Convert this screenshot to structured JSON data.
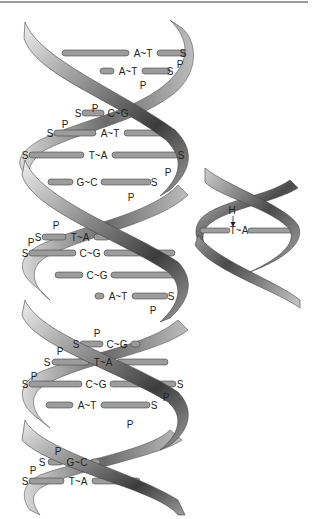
{
  "diagram": {
    "colors": {
      "ribbon_dark": "#3a3a3a",
      "ribbon_mid": "#8a8a8a",
      "ribbon_light": "#e6e6e6",
      "rod_fill": "#9c9c9c",
      "rod_stroke": "#444444",
      "text": "#222222",
      "top_border": "#9a9a9a"
    },
    "legend_symbols": {
      "S": "sugar (deoxyribose)",
      "P": "phosphate",
      "H": "hydrogen bond"
    },
    "base_pairs": [
      {
        "y": 53,
        "label": "A~T",
        "lx": 62,
        "rx": 185,
        "tx": 143,
        "s_left": null,
        "s_right": 183
      },
      {
        "y": 71,
        "label": "A~T",
        "lx": 100,
        "rx": 170,
        "tx": 128,
        "s_left": null,
        "s_right": 170
      },
      {
        "y": 113,
        "label": "C~G",
        "lx": 82,
        "rx": 140,
        "tx": 118,
        "s_left": 78,
        "s_right": null
      },
      {
        "y": 133,
        "label": "A~T",
        "lx": 54,
        "rx": 165,
        "tx": 110,
        "s_left": 50,
        "s_right": null
      },
      {
        "y": 155,
        "label": "T~A",
        "lx": 29,
        "rx": 179,
        "tx": 98,
        "s_left": 25,
        "s_right": 181
      },
      {
        "y": 182,
        "label": "G~C",
        "lx": 48,
        "rx": 151,
        "tx": 87,
        "s_left": null,
        "s_right": 154
      },
      {
        "y": 237,
        "label": "T~A",
        "lx": 42,
        "rx": 110,
        "tx": 80,
        "s_left": 38,
        "s_right": null
      },
      {
        "y": 253,
        "label": "C~G",
        "lx": 29,
        "rx": 175,
        "tx": 90,
        "s_left": 25,
        "s_right": null
      },
      {
        "y": 275,
        "label": "C~G",
        "lx": 55,
        "rx": 176,
        "tx": 97,
        "s_left": null,
        "s_right": null
      },
      {
        "y": 296,
        "label": "A~T",
        "lx": 95,
        "rx": 168,
        "tx": 118,
        "s_left": null,
        "s_right": 171
      },
      {
        "y": 344,
        "label": "C~G",
        "lx": 80,
        "rx": 140,
        "tx": 117,
        "s_left": 76,
        "s_right": null
      },
      {
        "y": 362,
        "label": "T~A",
        "lx": 52,
        "rx": 168,
        "tx": 103,
        "s_left": 47,
        "s_right": null
      },
      {
        "y": 384,
        "label": "C~G",
        "lx": 29,
        "rx": 176,
        "tx": 96,
        "s_left": 25,
        "s_right": 180
      },
      {
        "y": 405,
        "label": "A~T",
        "lx": 46,
        "rx": 150,
        "tx": 87,
        "s_left": null,
        "s_right": 154
      },
      {
        "y": 462,
        "label": "G~C",
        "lx": 48,
        "rx": 100,
        "tx": 77,
        "s_left": 42,
        "s_right": null
      },
      {
        "y": 481,
        "label": "T~A",
        "lx": 29,
        "rx": 140,
        "tx": 78,
        "s_left": 25,
        "s_right": null
      }
    ],
    "phosphates": [
      {
        "x": 180,
        "y": 64
      },
      {
        "x": 143,
        "y": 85
      },
      {
        "x": 95,
        "y": 108
      },
      {
        "x": 65,
        "y": 124
      },
      {
        "x": 168,
        "y": 172
      },
      {
        "x": 131,
        "y": 197
      },
      {
        "x": 56,
        "y": 225
      },
      {
        "x": 31,
        "y": 242
      },
      {
        "x": 153,
        "y": 310
      },
      {
        "x": 97,
        "y": 333
      },
      {
        "x": 60,
        "y": 351
      },
      {
        "x": 34,
        "y": 376
      },
      {
        "x": 166,
        "y": 397
      },
      {
        "x": 130,
        "y": 424
      },
      {
        "x": 58,
        "y": 451
      },
      {
        "x": 33,
        "y": 470
      }
    ],
    "inset": {
      "label": "T~A",
      "hydrogen_label": "H",
      "arrow": "down-arrow"
    }
  }
}
